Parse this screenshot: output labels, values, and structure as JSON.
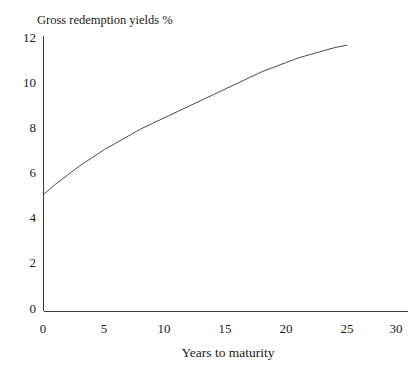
{
  "chart_data": {
    "type": "line",
    "title": "Gross redemption yields %",
    "xlabel": "Years to maturity",
    "ylabel": "",
    "xlim": [
      0,
      30
    ],
    "ylim": [
      0,
      12
    ],
    "grid": false,
    "legend": null,
    "xticks": [
      "0",
      "5",
      "10",
      "15",
      "20",
      "25",
      "30"
    ],
    "yticks": [
      "0",
      "2",
      "4",
      "6",
      "8",
      "10",
      "12"
    ],
    "xtick_values": [
      0,
      5,
      10,
      15,
      20,
      25,
      30
    ],
    "ytick_values": [
      0,
      2,
      4,
      6,
      8,
      10,
      12
    ],
    "series": [
      {
        "name": "Gross redemption yield curve",
        "color": "#4a4a50",
        "x": [
          0,
          1,
          2,
          3,
          4,
          5,
          6,
          7,
          8,
          9,
          10,
          11,
          12,
          13,
          14,
          15,
          16,
          17,
          18,
          19,
          20,
          21,
          22,
          23,
          24,
          25
        ],
        "values": [
          5.1,
          5.55,
          5.95,
          6.35,
          6.7,
          7.05,
          7.35,
          7.65,
          7.95,
          8.2,
          8.45,
          8.7,
          8.95,
          9.2,
          9.45,
          9.7,
          9.95,
          10.2,
          10.45,
          10.65,
          10.85,
          11.05,
          11.2,
          11.35,
          11.5,
          11.6
        ]
      }
    ]
  },
  "axes": {
    "title": "Gross redemption yields %",
    "x_axis_label": "Years to maturity"
  }
}
